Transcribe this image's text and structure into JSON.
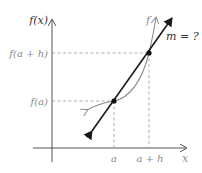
{
  "diagram": {
    "labels": {
      "y_axis": "f(x)",
      "x_axis": "x",
      "curve": "f",
      "slope": "m = ?",
      "f_a_plus_h": "f(a + h)",
      "f_a": "f(a)",
      "a": "a",
      "a_plus_h": "a + h"
    },
    "colors": {
      "axis": "#555555",
      "curve": "#8c8c8c",
      "secant": "#1a1a1a",
      "dashed": "#9a9a9a",
      "point": "#111111"
    },
    "points": [
      {
        "name": "P",
        "x": "a",
        "y": "f(a)"
      },
      {
        "name": "Q",
        "x": "a + h",
        "y": "f(a + h)"
      }
    ]
  }
}
